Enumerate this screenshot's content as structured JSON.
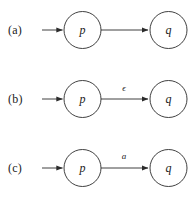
{
  "figure": {
    "background_color": "#ffffff",
    "stroke_color": "#2b2b2b",
    "text_color": "#1b1b1b",
    "caption_style": "three labelled transition diagrams",
    "rows": [
      {
        "label": "(a)",
        "from_state": "p",
        "to_state": "q",
        "edge_label": "",
        "has_edge_label": false,
        "has_incoming_arrow": true
      },
      {
        "label": "(b)",
        "from_state": "p",
        "to_state": "q",
        "edge_label": "ϵ",
        "has_edge_label": true,
        "has_incoming_arrow": true
      },
      {
        "label": "(c)",
        "from_state": "p",
        "to_state": "q",
        "edge_label": "a",
        "has_edge_label": true,
        "has_incoming_arrow": true
      }
    ]
  }
}
